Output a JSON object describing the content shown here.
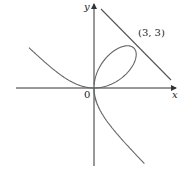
{
  "diagram": {
    "axes": {
      "x_label": "x",
      "y_label": "y",
      "origin_label": "0"
    },
    "point": {
      "label": "(3, 3)",
      "x": 3,
      "y": 3
    },
    "curve": "x^3 + y^3 = 6xy",
    "tangent": "x + y = 6",
    "colors": {
      "curve": "#555555",
      "axes": "#333333"
    }
  }
}
